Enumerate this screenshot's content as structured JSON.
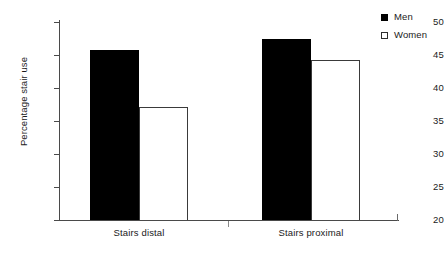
{
  "chart_data": {
    "type": "bar",
    "title": "",
    "xlabel": "",
    "ylabel": "Percentage stair use",
    "categories": [
      "Stairs distal",
      "Stairs proximal"
    ],
    "series": [
      {
        "name": "Men",
        "values": [
          45.8,
          47.5
        ],
        "color": "#000000"
      },
      {
        "name": "Women",
        "values": [
          37.1,
          44.3
        ],
        "color": "#ffffff"
      }
    ],
    "ylim": [
      20,
      50
    ],
    "yticks": [
      20,
      25,
      30,
      35,
      40,
      45,
      50
    ],
    "ytick_labels": [
      "20",
      "25",
      "30",
      "35",
      "40",
      "45",
      "50"
    ],
    "grid": false,
    "legend_position": "top-right"
  },
  "legend": {
    "items": [
      {
        "label": "Men",
        "swatch": "filled-square-icon"
      },
      {
        "label": "Women",
        "swatch": "open-square-icon"
      }
    ]
  }
}
